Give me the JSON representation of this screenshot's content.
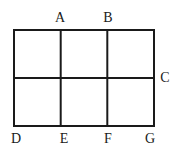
{
  "figure": {
    "type": "geometry-diagram",
    "background_color": "#ffffff",
    "line_color": "#1a1a1a",
    "line_width": 2,
    "rectangle": {
      "left": 14,
      "top": 30,
      "right": 154,
      "bottom": 126,
      "width": 140,
      "height": 96
    },
    "grid": {
      "columns": 3,
      "rows": 2,
      "vertical_line_x": [
        60.7,
        107.3
      ],
      "horizontal_line_y": [
        78
      ]
    },
    "labels": [
      {
        "id": "A",
        "text": "A",
        "x": 60,
        "y": 18,
        "position": "top"
      },
      {
        "id": "B",
        "text": "B",
        "x": 108,
        "y": 18,
        "position": "top"
      },
      {
        "id": "C",
        "text": "C",
        "x": 165,
        "y": 78,
        "position": "right"
      },
      {
        "id": "D",
        "text": "D",
        "x": 16,
        "y": 139,
        "position": "bottom"
      },
      {
        "id": "E",
        "text": "E",
        "x": 64,
        "y": 139,
        "position": "bottom"
      },
      {
        "id": "F",
        "text": "F",
        "x": 108,
        "y": 139,
        "position": "bottom"
      },
      {
        "id": "G",
        "text": "G",
        "x": 150,
        "y": 139,
        "position": "bottom"
      }
    ]
  }
}
